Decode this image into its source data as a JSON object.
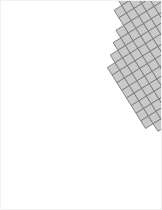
{
  "figure": {
    "title": "",
    "type": "raster-grid-map",
    "background_color": "#ffffff",
    "border_color": "#f2f2f2",
    "width_px": 162,
    "height_px": 210
  },
  "grid": {
    "cell_size_px": 9.0,
    "cell_gap_px": 0.0,
    "rotation_deg": -32,
    "origin_x_px": 74,
    "origin_y_px": 14,
    "columns": 22,
    "rows": 22,
    "normal_cell_color": "#c9c9c9",
    "normal_cell_border_color": "#787878",
    "marked_cell_color": "#000000",
    "marked_cell_border_color": "#000000",
    "marked_cells": [
      [
        13,
        8
      ]
    ],
    "legend": {
      "normal_label": "grid cell",
      "marked_label": "selected cell"
    },
    "row_extents": [
      [
        6,
        9
      ],
      [
        5,
        9
      ],
      [
        4,
        9
      ],
      [
        4,
        9
      ],
      [
        3,
        10
      ],
      [
        2,
        11
      ],
      [
        1,
        12
      ],
      [
        0,
        13
      ],
      [
        0,
        14
      ],
      [
        0,
        15
      ],
      [
        0,
        16
      ],
      [
        0,
        16
      ],
      [
        0,
        17
      ],
      [
        0,
        17
      ],
      [
        0,
        16
      ],
      [
        1,
        15
      ],
      [
        2,
        14
      ],
      [
        3,
        13
      ],
      [
        4,
        12
      ],
      [
        5,
        11
      ],
      [
        6,
        10
      ],
      [
        7,
        9
      ]
    ]
  }
}
